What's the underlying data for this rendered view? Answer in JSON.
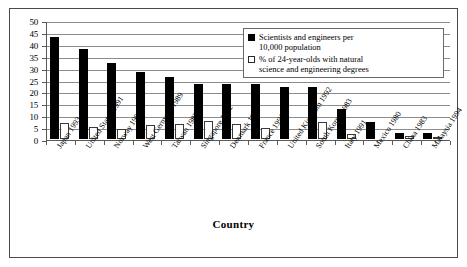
{
  "chart_data": {
    "type": "bar",
    "title": "",
    "xlabel": "Country",
    "ylabel": "",
    "ylim": [
      0,
      50
    ],
    "yticks": [
      0,
      5,
      10,
      15,
      20,
      25,
      30,
      35,
      40,
      45,
      50
    ],
    "grid": true,
    "legend_position": "upper right",
    "categories": [
      "Japan 1993",
      "United States 1991",
      "Norway 1992",
      "West Germany 1989",
      "Taiwan 1983",
      "Singapore 1992",
      "Denmark 1991",
      "France 1991",
      "United Kingdom 1992",
      "South Korea 1983",
      "Italy 1991",
      "Mexico 1980",
      "China 1983",
      "Malaysia 1994"
    ],
    "series": [
      {
        "name": "Scientists and engineers per 10,000 population",
        "color": "#000000",
        "values": [
          43,
          38,
          32,
          28,
          26,
          23,
          23,
          23,
          22,
          22,
          12.8,
          7.2,
          2.6,
          2.5
        ]
      },
      {
        "name": "% of 24-year-olds with natural science and engineering degrees",
        "color": "#ffffff",
        "values": [
          6.7,
          5.0,
          4.3,
          6.0,
          6.4,
          7.4,
          6.5,
          4.7,
          0,
          7.3,
          2.2,
          0,
          1.4,
          0.9
        ]
      }
    ]
  },
  "axes": {
    "x_title": "Country",
    "y_tick_labels": [
      "50",
      "45",
      "40",
      "35",
      "30",
      "25",
      "20",
      "15",
      "10",
      "5",
      "0"
    ]
  },
  "legend": {
    "items": [
      {
        "swatch": "filled-black-square",
        "line1": "Scientists and engineers per",
        "line2": "10,000 population"
      },
      {
        "swatch": "outlined-white-square",
        "line1": "% of 24-year-olds with natural",
        "line2": "science and engineering degrees"
      }
    ]
  }
}
